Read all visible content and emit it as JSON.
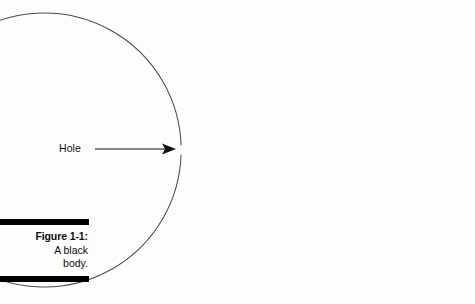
{
  "figure": {
    "background_color": "#fdfdfd",
    "caption": {
      "number_label": "Figure 1-1:",
      "description_lines": [
        "A black",
        "body."
      ],
      "rule_color": "#000000",
      "text_color": "#0d0d0d"
    },
    "callout": {
      "label": "Hole",
      "arrow_color": "#111111"
    },
    "diagram": {
      "shape_name": "black-body-cavity-circle",
      "stroke_color": "#4a4a4a",
      "fill_color": "none"
    }
  },
  "chart_data": {
    "type": "diagram",
    "title": "A black body.",
    "elements": [
      {
        "name": "body-circle",
        "kind": "circle",
        "center_x": 318,
        "center_y": 150,
        "radius": 137,
        "stroke": "#4a4a4a",
        "stroke_width": 1,
        "fill": "none",
        "gap_start_deg": 177.0,
        "gap_end_deg": 183.0,
        "note": "circle outline interrupted by a small opening on its left side"
      },
      {
        "name": "hole-gap",
        "kind": "gap",
        "x": 182,
        "y_top": 145,
        "y_bottom": 155,
        "note": "the hole in the black body wall"
      },
      {
        "name": "callout-arrow",
        "kind": "arrow",
        "x1": 95,
        "y1": 149,
        "x2": 176,
        "y2": 149,
        "stroke": "#111111",
        "stroke_width": 1.2,
        "head": "solid-triangle"
      },
      {
        "name": "hole-text",
        "kind": "text",
        "x": 60,
        "y": 153,
        "text": "Hole"
      }
    ],
    "xlim": [
      0,
      475
    ],
    "ylim": [
      0,
      304
    ],
    "grid": false,
    "legend": null
  }
}
